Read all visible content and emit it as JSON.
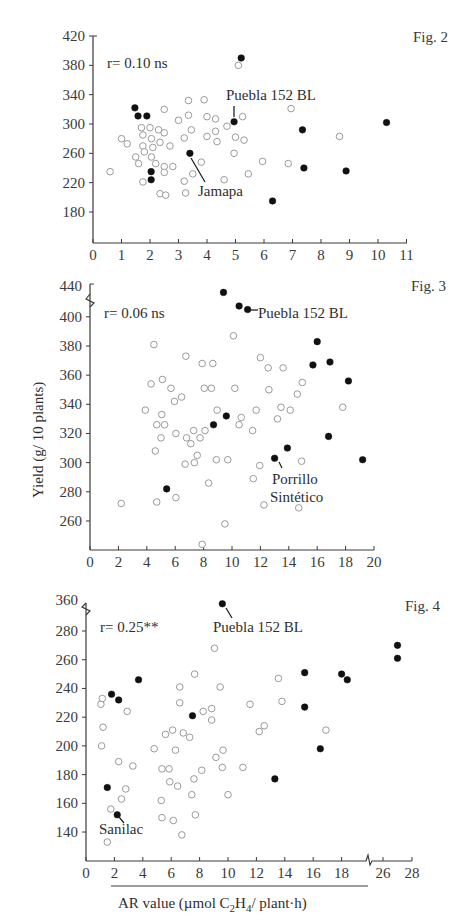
{
  "y_axis_label": "Yield (g/ 10 plants)",
  "x_axis_label": "AR value (µmol C₂H₄/ plant·h)",
  "chart_data": [
    {
      "type": "scatter",
      "title": "Fig. 2",
      "annotation": "r= 0.10 ns",
      "xlabel": "",
      "ylabel": "Yield (g/ 10 plants)",
      "xlim": [
        0,
        11
      ],
      "ylim": [
        138,
        420
      ],
      "xticks": [
        0,
        1,
        2,
        3,
        4,
        5,
        6,
        7,
        8,
        9,
        10,
        11
      ],
      "yticks": [
        180,
        220,
        260,
        300,
        340,
        380,
        420
      ],
      "grid": false,
      "labels": [
        {
          "text": "Puebla 152 BL",
          "x": 4.95,
          "y": 303
        },
        {
          "text": "Jamapa",
          "x": 3.4,
          "y": 260
        }
      ],
      "series": [
        {
          "name": "filled",
          "points": [
            [
              1.47,
              322
            ],
            [
              1.58,
              311
            ],
            [
              1.89,
              311
            ],
            [
              2.04,
              235
            ],
            [
              2.04,
              224
            ],
            [
              3.4,
              260
            ],
            [
              4.95,
              303
            ],
            [
              5.2,
              390
            ],
            [
              6.3,
              195
            ],
            [
              7.35,
              292
            ],
            [
              7.4,
              240
            ],
            [
              8.88,
              236
            ],
            [
              10.3,
              302
            ]
          ]
        },
        {
          "name": "open",
          "points": [
            [
              0.6,
              235
            ],
            [
              1.0,
              280
            ],
            [
              1.2,
              273
            ],
            [
              1.5,
              255
            ],
            [
              1.6,
              246
            ],
            [
              1.7,
              295
            ],
            [
              1.75,
              285
            ],
            [
              1.75,
              270
            ],
            [
              1.75,
              221
            ],
            [
              1.8,
              262
            ],
            [
              2.0,
              295
            ],
            [
              2.05,
              280
            ],
            [
              2.05,
              255
            ],
            [
              2.1,
              268
            ],
            [
              2.2,
              246
            ],
            [
              2.3,
              292
            ],
            [
              2.35,
              275
            ],
            [
              2.35,
              205
            ],
            [
              2.5,
              320
            ],
            [
              2.5,
              288
            ],
            [
              2.5,
              242
            ],
            [
              2.5,
              234
            ],
            [
              2.55,
              203
            ],
            [
              2.7,
              270
            ],
            [
              2.8,
              242
            ],
            [
              3.0,
              305
            ],
            [
              3.2,
              281
            ],
            [
              3.2,
              222
            ],
            [
              3.25,
              206
            ],
            [
              3.35,
              332
            ],
            [
              3.35,
              312
            ],
            [
              3.45,
              292
            ],
            [
              3.5,
              232
            ],
            [
              3.8,
              248
            ],
            [
              3.9,
              333
            ],
            [
              4.0,
              310
            ],
            [
              4.0,
              283
            ],
            [
              4.3,
              307
            ],
            [
              4.3,
              290
            ],
            [
              4.35,
              276
            ],
            [
              4.6,
              224
            ],
            [
              4.7,
              297
            ],
            [
              4.95,
              260
            ],
            [
              5.0,
              282
            ],
            [
              5.1,
              380
            ],
            [
              5.25,
              310
            ],
            [
              5.3,
              278
            ],
            [
              5.45,
              232
            ],
            [
              5.95,
              249
            ],
            [
              6.85,
              246
            ],
            [
              6.95,
              321
            ],
            [
              8.65,
              283
            ]
          ]
        }
      ]
    },
    {
      "type": "scatter",
      "title": "Fig. 3",
      "annotation": "r= 0.06 ns",
      "xlabel": "",
      "ylabel": "Yield (g/ 10 plants)",
      "xlim": [
        0,
        20
      ],
      "ylim": [
        240,
        440
      ],
      "axis_break_y": "between 400 and 440",
      "xticks": [
        0,
        2,
        4,
        6,
        8,
        10,
        12,
        14,
        16,
        18,
        20
      ],
      "yticks": [
        260,
        280,
        300,
        320,
        340,
        360,
        380,
        400,
        440
      ],
      "grid": false,
      "labels": [
        {
          "text": "Puebla 152 BL",
          "x": 11.1,
          "y": 405
        },
        {
          "text": "Porrillo Sintético",
          "x": 13.0,
          "y": 303
        }
      ],
      "series": [
        {
          "name": "filled",
          "points": [
            [
              9.4,
              432
            ],
            [
              10.5,
              419
            ],
            [
              11.1,
              405
            ],
            [
              16.0,
              383
            ],
            [
              15.7,
              367
            ],
            [
              16.9,
              369
            ],
            [
              18.2,
              356
            ],
            [
              9.6,
              332
            ],
            [
              8.7,
              326
            ],
            [
              16.8,
              318
            ],
            [
              13.9,
              310
            ],
            [
              13.0,
              303
            ],
            [
              19.2,
              302
            ],
            [
              5.4,
              282
            ]
          ]
        },
        {
          "name": "open",
          "points": [
            [
              2.2,
              272
            ],
            [
              3.9,
              336
            ],
            [
              4.3,
              354
            ],
            [
              4.5,
              381
            ],
            [
              4.6,
              308
            ],
            [
              4.7,
              326
            ],
            [
              4.7,
              273
            ],
            [
              5.0,
              317
            ],
            [
              5.05,
              333
            ],
            [
              5.1,
              357
            ],
            [
              5.25,
              326
            ],
            [
              5.7,
              351
            ],
            [
              5.95,
              342
            ],
            [
              6.05,
              320
            ],
            [
              6.05,
              276
            ],
            [
              6.45,
              345
            ],
            [
              6.7,
              299
            ],
            [
              6.75,
              373
            ],
            [
              6.8,
              317
            ],
            [
              7.1,
              313
            ],
            [
              7.3,
              322
            ],
            [
              7.35,
              300
            ],
            [
              7.55,
              305
            ],
            [
              7.75,
              317
            ],
            [
              7.9,
              368
            ],
            [
              7.9,
              244
            ],
            [
              8.05,
              351
            ],
            [
              8.1,
              322
            ],
            [
              8.35,
              286
            ],
            [
              8.55,
              351
            ],
            [
              8.65,
              368
            ],
            [
              8.9,
              302
            ],
            [
              8.95,
              336
            ],
            [
              9.5,
              258
            ],
            [
              9.7,
              302
            ],
            [
              10.1,
              387
            ],
            [
              10.2,
              351
            ],
            [
              10.5,
              326
            ],
            [
              10.65,
              331
            ],
            [
              11.45,
              322
            ],
            [
              11.5,
              289
            ],
            [
              11.7,
              336
            ],
            [
              11.95,
              298
            ],
            [
              12.0,
              372
            ],
            [
              12.25,
              271
            ],
            [
              12.55,
              365
            ],
            [
              12.6,
              350
            ],
            [
              13.2,
              330
            ],
            [
              13.45,
              338
            ],
            [
              13.6,
              365
            ],
            [
              14.1,
              336
            ],
            [
              14.6,
              347
            ],
            [
              14.7,
              269
            ],
            [
              14.9,
              301
            ],
            [
              14.95,
              355
            ],
            [
              17.8,
              338
            ]
          ]
        }
      ]
    },
    {
      "type": "scatter",
      "title": "Fig. 4",
      "annotation": "r= 0.25**",
      "xlabel": "AR value (µmol C₂H₄/ plant·h)",
      "ylabel": "Yield (g/ 10 plants)",
      "xlim": [
        0,
        28
      ],
      "ylim": [
        120,
        360
      ],
      "axis_break_x": "between 18 and 26",
      "axis_break_y": "between 280 and 360",
      "xticks": [
        0,
        2,
        4,
        6,
        8,
        10,
        12,
        14,
        16,
        18,
        26,
        28
      ],
      "yticks": [
        140,
        160,
        180,
        200,
        220,
        240,
        260,
        280,
        360
      ],
      "grid": false,
      "labels": [
        {
          "text": "Puebla 152 BL",
          "x": 9.6,
          "y": 352
        },
        {
          "text": "Sanilac",
          "x": 2.2,
          "y": 152
        }
      ],
      "series": [
        {
          "name": "filled",
          "points": [
            [
              9.6,
              352
            ],
            [
              1.8,
              236
            ],
            [
              2.3,
              232
            ],
            [
              3.7,
              246
            ],
            [
              7.5,
              221
            ],
            [
              15.4,
              251
            ],
            [
              15.4,
              227
            ],
            [
              16.5,
              198
            ],
            [
              13.3,
              177
            ],
            [
              18.0,
              250
            ],
            [
              18.4,
              246
            ],
            [
              27.0,
              270
            ],
            [
              27.0,
              261
            ],
            [
              1.5,
              171
            ],
            [
              2.2,
              152
            ]
          ]
        },
        {
          "name": "open",
          "points": [
            [
              1.05,
              229
            ],
            [
              1.15,
              233
            ],
            [
              1.2,
              213
            ],
            [
              1.1,
              200
            ],
            [
              1.5,
              133
            ],
            [
              1.75,
              156
            ],
            [
              2.3,
              189
            ],
            [
              2.5,
              163
            ],
            [
              2.8,
              170
            ],
            [
              2.9,
              224
            ],
            [
              3.3,
              186
            ],
            [
              4.8,
              198
            ],
            [
              5.3,
              162
            ],
            [
              5.35,
              184
            ],
            [
              5.35,
              150
            ],
            [
              5.6,
              208
            ],
            [
              5.85,
              184
            ],
            [
              5.9,
              175
            ],
            [
              6.1,
              211
            ],
            [
              6.15,
              148
            ],
            [
              6.3,
              197
            ],
            [
              6.45,
              172
            ],
            [
              6.6,
              241
            ],
            [
              6.6,
              230
            ],
            [
              6.75,
              138
            ],
            [
              6.85,
              209
            ],
            [
              7.3,
              206
            ],
            [
              7.45,
              166
            ],
            [
              7.6,
              177
            ],
            [
              7.65,
              250
            ],
            [
              7.7,
              152
            ],
            [
              8.15,
              183
            ],
            [
              8.25,
              224
            ],
            [
              8.85,
              226
            ],
            [
              8.85,
              218
            ],
            [
              9.05,
              268
            ],
            [
              9.15,
              192
            ],
            [
              9.45,
              241
            ],
            [
              9.65,
              197
            ],
            [
              9.6,
              185
            ],
            [
              10.0,
              166
            ],
            [
              11.05,
              185
            ],
            [
              11.55,
              229
            ],
            [
              12.2,
              210
            ],
            [
              12.55,
              214
            ],
            [
              13.55,
              247
            ],
            [
              13.8,
              231
            ],
            [
              16.9,
              211
            ]
          ]
        }
      ]
    }
  ]
}
